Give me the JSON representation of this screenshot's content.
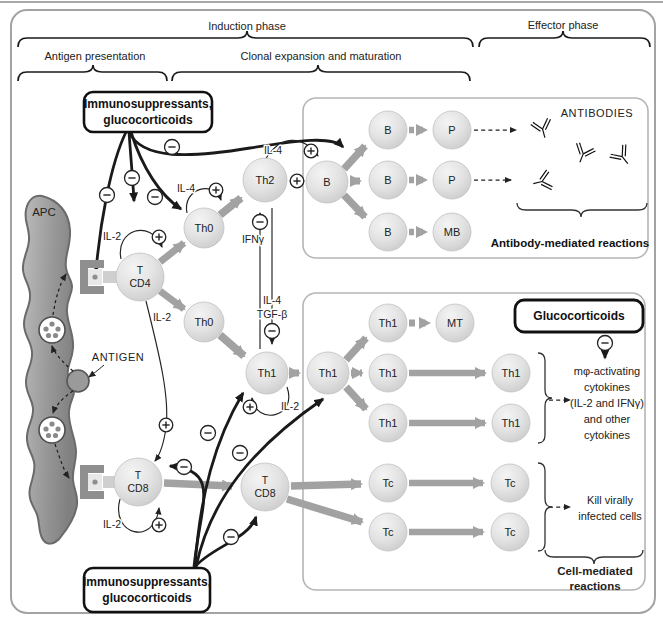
{
  "figure": {
    "header": {
      "induction_phase": "Induction phase",
      "effector_phase": "Effector phase",
      "antigen_presentation": "Antigen presentation",
      "clonal_expansion": "Clonal expansion and maturation"
    },
    "boxes": {
      "immunosuppressants_top": {
        "line1": "Immunosuppressants,",
        "line2": "glucocorticoids"
      },
      "immunosuppressants_bottom": {
        "line1": "Immunosuppressants,",
        "line2": "glucocorticoids"
      },
      "glucocorticoids": "Glucocorticoids"
    },
    "apc": {
      "label": "APC",
      "antigen": "ANTIGEN"
    },
    "cytokines": {
      "il2": "IL-2",
      "il4": "IL-4",
      "ifng": "IFNγ",
      "tgfb": "TGF-β"
    },
    "antibody_panel": {
      "title": "ANTIBODIES",
      "caption": "Antibody-mediated reactions"
    },
    "cell_panel": {
      "caption_line1": "Cell-mediated",
      "caption_line2": "reactions",
      "kill_line1": "Kill virally",
      "kill_line2": "infected cells",
      "mphi_lines": [
        "mφ-activating",
        "cytokines",
        "(IL-2 and IFNγ)",
        "and other",
        "cytokines"
      ]
    },
    "cells": [
      {
        "id": "cd4",
        "lines": [
          "T",
          "CD4"
        ]
      },
      {
        "id": "th0a",
        "lines": [
          "Th0"
        ]
      },
      {
        "id": "th0b",
        "lines": [
          "Th0"
        ]
      },
      {
        "id": "th2",
        "lines": [
          "Th2"
        ]
      },
      {
        "id": "bhub",
        "lines": [
          "B"
        ]
      },
      {
        "id": "b1",
        "lines": [
          "B"
        ]
      },
      {
        "id": "p1",
        "lines": [
          "P"
        ]
      },
      {
        "id": "b2",
        "lines": [
          "B"
        ]
      },
      {
        "id": "p2",
        "lines": [
          "P"
        ]
      },
      {
        "id": "b3",
        "lines": [
          "B"
        ]
      },
      {
        "id": "mb",
        "lines": [
          "MB"
        ]
      },
      {
        "id": "th1a",
        "lines": [
          "Th1"
        ]
      },
      {
        "id": "th1hub",
        "lines": [
          "Th1"
        ]
      },
      {
        "id": "th1r1",
        "lines": [
          "Th1"
        ]
      },
      {
        "id": "mt",
        "lines": [
          "MT"
        ]
      },
      {
        "id": "th1r2",
        "lines": [
          "Th1"
        ]
      },
      {
        "id": "th1r2b",
        "lines": [
          "Th1"
        ]
      },
      {
        "id": "th1r3",
        "lines": [
          "Th1"
        ]
      },
      {
        "id": "th1r3b",
        "lines": [
          "Th1"
        ]
      },
      {
        "id": "cd8a",
        "lines": [
          "T",
          "CD8"
        ]
      },
      {
        "id": "cd8b",
        "lines": [
          "T",
          "CD8"
        ]
      },
      {
        "id": "tc1",
        "lines": [
          "Tc"
        ]
      },
      {
        "id": "tc1b",
        "lines": [
          "Tc"
        ]
      },
      {
        "id": "tc2",
        "lines": [
          "Tc"
        ]
      },
      {
        "id": "tc2b",
        "lines": [
          "Tc"
        ]
      }
    ]
  },
  "colors": {
    "arrow_gray": "#a2a2a2",
    "inhibit_black": "#1a1a1a",
    "panel_border": "#b5b5b5",
    "cell_fill": "#e3e3e3"
  }
}
